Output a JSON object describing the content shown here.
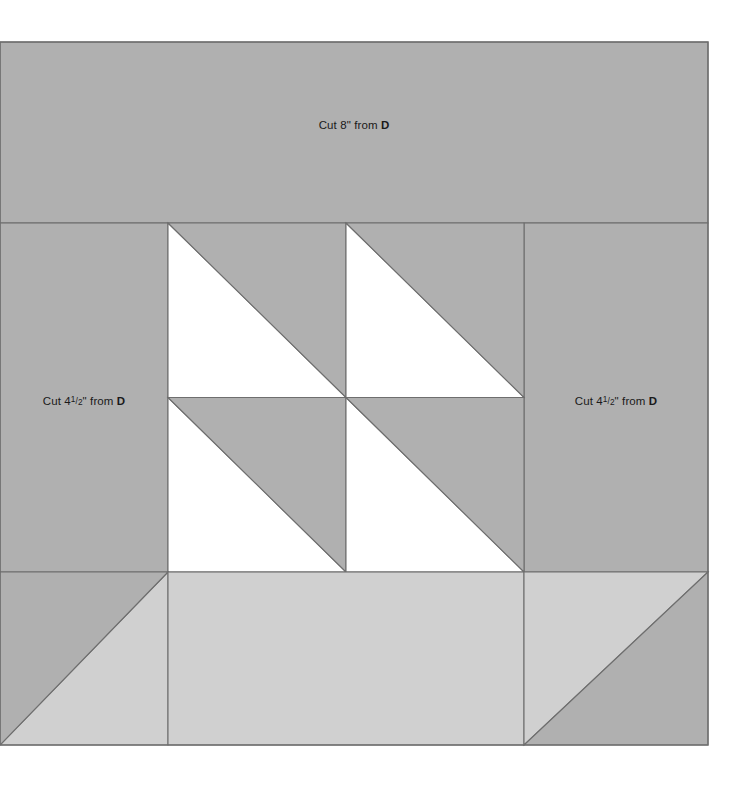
{
  "diagram": {
    "type": "quilt-block-piecing-diagram",
    "canvas": {
      "width": 745,
      "height": 790
    },
    "block": {
      "x": 0,
      "y": 42,
      "width": 708,
      "height": 703
    },
    "colors": {
      "medium_gray": "#b0b0b0",
      "light_gray": "#d0d0d0",
      "white": "#ffffff",
      "stroke": "#6e6e6e",
      "text": "#1a1a1a",
      "background": "#ffffff"
    },
    "labels": {
      "top": {
        "prefix": "Cut 8\" from ",
        "fabric": "D",
        "full_text": "Cut 8\" from D",
        "measurement": "8\""
      },
      "left": {
        "prefix": "Cut 4",
        "fraction_numerator": "1",
        "fraction_slash": "/",
        "fraction_denominator": "2",
        "suffix": "\" from ",
        "fabric": "D",
        "full_text": "Cut 4 1/2\" from D",
        "measurement": "4 1/2\""
      },
      "right": {
        "prefix": "Cut 4",
        "fraction_numerator": "1",
        "fraction_slash": "/",
        "fraction_denominator": "2",
        "suffix": "\" from ",
        "fabric": "D",
        "full_text": "Cut 4 1/2\" from D",
        "measurement": "4 1/2\""
      }
    },
    "regions": [
      {
        "name": "top-border-strip",
        "fill": "medium_gray",
        "x": 0,
        "y": 42,
        "width": 708,
        "height": 181
      },
      {
        "name": "left-border-strip",
        "fill": "medium_gray",
        "x": 0,
        "y": 223,
        "width": 168,
        "height": 349
      },
      {
        "name": "right-border-strip",
        "fill": "medium_gray",
        "x": 524,
        "y": 223,
        "width": 184,
        "height": 349
      },
      {
        "name": "hst-grid",
        "x": 168,
        "y": 223,
        "width": 356,
        "height": 349,
        "rows": 2,
        "cols": 2
      },
      {
        "name": "bottom-band",
        "y": 572,
        "height": 173
      }
    ],
    "hst_cells": [
      {
        "name": "hst-top-left",
        "light_half": "lower-left",
        "dark_half": "upper-right"
      },
      {
        "name": "hst-top-right",
        "light_half": "lower-left",
        "dark_half": "upper-right"
      },
      {
        "name": "hst-bottom-left",
        "light_half": "lower-left",
        "dark_half": "upper-right"
      },
      {
        "name": "hst-bottom-right",
        "light_half": "lower-left",
        "dark_half": "upper-right"
      }
    ],
    "bottom_units": [
      {
        "name": "bottom-left-triangle-unit",
        "upper_left": "medium_gray",
        "lower_right": "light_gray"
      },
      {
        "name": "bottom-center-strip",
        "fill": "light_gray"
      },
      {
        "name": "bottom-right-triangle-unit",
        "upper_left": "light_gray",
        "lower_right": "medium_gray"
      }
    ]
  }
}
